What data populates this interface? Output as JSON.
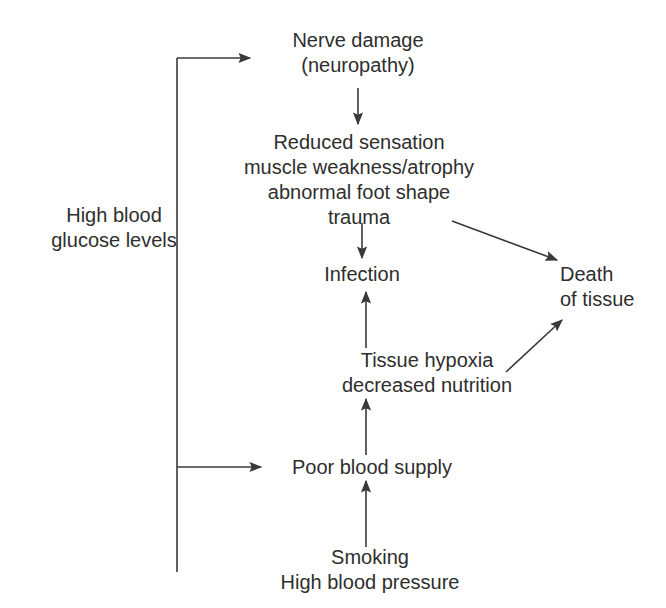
{
  "diagram": {
    "background_color": "#ffffff",
    "text_color": "#2e2e2e",
    "line_color": "#3a3a3a",
    "nodes": {
      "glucose": {
        "lines": [
          "High blood",
          "glucose levels"
        ]
      },
      "nerve": {
        "lines": [
          "Nerve damage",
          "(neuropathy)"
        ]
      },
      "reduced": {
        "lines": [
          "Reduced sensation",
          "muscle weakness/atrophy",
          "abnormal foot shape",
          "trauma"
        ]
      },
      "infection": {
        "lines": [
          "Infection"
        ]
      },
      "death": {
        "lines": [
          "Death",
          "of tissue"
        ]
      },
      "hypoxia": {
        "lines": [
          "Tissue hypoxia",
          "decreased nutrition"
        ]
      },
      "poor": {
        "lines": [
          "Poor blood supply"
        ]
      },
      "smoking": {
        "lines": [
          "Smoking",
          "High blood pressure"
        ]
      }
    },
    "edges": [
      {
        "name": "glucose-to-nerve-damage",
        "from": "glucose",
        "to": "nerve",
        "style": "elbow-right-arrow"
      },
      {
        "name": "glucose-to-poor-blood-supply",
        "from": "glucose",
        "to": "poor",
        "style": "branch-right-arrow"
      },
      {
        "name": "nerve-damage-to-reduced-sensation",
        "from": "nerve",
        "to": "reduced",
        "style": "vertical-down-arrow"
      },
      {
        "name": "reduced-sensation-to-infection",
        "from": "reduced",
        "to": "infection",
        "style": "vertical-down-arrow"
      },
      {
        "name": "reduced-sensation-to-death-of-tissue",
        "from": "reduced",
        "to": "death",
        "style": "diagonal-down-right-arrow"
      },
      {
        "name": "tissue-hypoxia-to-infection",
        "from": "hypoxia",
        "to": "infection",
        "style": "vertical-up-arrow"
      },
      {
        "name": "tissue-hypoxia-to-death-of-tissue",
        "from": "hypoxia",
        "to": "death",
        "style": "diagonal-up-right-arrow"
      },
      {
        "name": "poor-blood-supply-to-tissue-hypoxia",
        "from": "poor",
        "to": "hypoxia",
        "style": "vertical-up-arrow"
      },
      {
        "name": "smoking-to-poor-blood-supply",
        "from": "smoking",
        "to": "poor",
        "style": "vertical-up-arrow"
      },
      {
        "name": "smoking-trunk-to-glucose-spine",
        "from": "smoking",
        "to": "glucose",
        "style": "vertical-line"
      }
    ]
  }
}
